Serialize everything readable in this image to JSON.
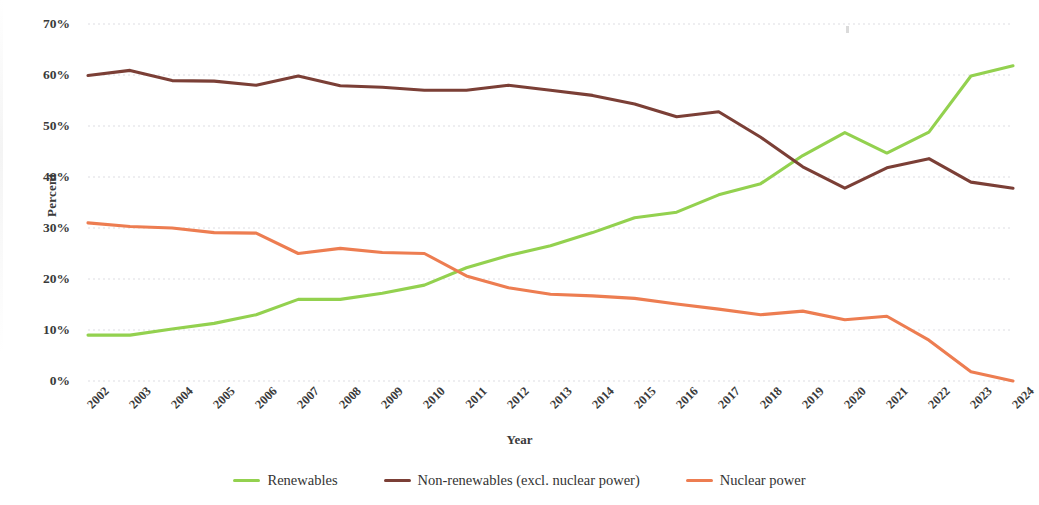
{
  "chart_data": {
    "type": "line",
    "title": "",
    "xlabel": "Year",
    "ylabel": "Percent",
    "x": [
      2002,
      2003,
      2004,
      2005,
      2006,
      2007,
      2008,
      2009,
      2010,
      2011,
      2012,
      2013,
      2014,
      2015,
      2016,
      2017,
      2018,
      2019,
      2020,
      2021,
      2022,
      2023,
      2024
    ],
    "xtick_labels": [
      "2002",
      "2003",
      "2004",
      "2005",
      "2006",
      "2007",
      "2008",
      "2009",
      "2010",
      "2011",
      "2012",
      "2013",
      "2014",
      "2015",
      "2016",
      "2017",
      "2018",
      "2019",
      "2020",
      "2021",
      "2022",
      "2023",
      "2024"
    ],
    "ytick_labels": [
      "70%",
      "60%",
      "50%",
      "40%",
      "30%",
      "20%",
      "10%",
      "0%"
    ],
    "ytick_values": [
      70,
      60,
      50,
      40,
      30,
      20,
      10,
      0
    ],
    "ylim": [
      0,
      70
    ],
    "xlim": [
      2002,
      2024
    ],
    "grid": true,
    "legend_position": "bottom",
    "series": [
      {
        "name": "Renewables",
        "color": "#93D14F",
        "values": [
          9.0,
          9.0,
          10.2,
          11.3,
          13.0,
          16.0,
          16.0,
          17.2,
          18.8,
          22.2,
          24.6,
          26.5,
          29.1,
          32.0,
          33.1,
          36.5,
          38.7,
          44.2,
          48.7,
          44.7,
          48.8,
          59.8,
          61.8
        ]
      },
      {
        "name": "Non-renewables (excl. nuclear power)",
        "color": "#7B3F36",
        "values": [
          59.9,
          60.9,
          58.9,
          58.8,
          58.0,
          59.8,
          57.9,
          57.6,
          57.0,
          57.0,
          58.0,
          57.0,
          56.0,
          54.3,
          51.8,
          52.8,
          47.8,
          42.0,
          37.8,
          41.8,
          43.6,
          39.0,
          37.8
        ]
      },
      {
        "name": "Nuclear power",
        "color": "#ED7D51",
        "values": [
          31.0,
          30.3,
          30.0,
          29.1,
          29.0,
          25.0,
          26.0,
          25.2,
          25.0,
          20.6,
          18.3,
          17.0,
          16.7,
          16.2,
          15.1,
          14.1,
          13.0,
          13.7,
          12.0,
          12.7,
          8.0,
          1.8,
          0.0
        ]
      }
    ]
  }
}
